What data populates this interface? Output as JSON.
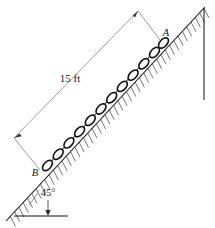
{
  "figure": {
    "type": "engineering-mechanics-free-body-diagram",
    "background_color": "#ffffff",
    "ink_color": "#111111",
    "dimension_color": "#8a8a8a",
    "labels": {
      "point_top": "A",
      "point_bottom": "B",
      "length": "15 ft",
      "angle": "45°"
    },
    "incline": {
      "angle_degrees": 45,
      "hatching_side": "below",
      "hatch_count": 46,
      "surface_start": {
        "x": 6,
        "y": 221
      },
      "surface_end": {
        "x": 205,
        "y": 7
      }
    },
    "chain": {
      "link_count": 12,
      "link_shape": "elongated-oval",
      "start": {
        "x": 45,
        "y": 168
      },
      "end": {
        "x": 163,
        "y": 42
      }
    },
    "dimension_line": {
      "label": "15 ft",
      "value": 15,
      "units": "ft",
      "arrow_ends": 2,
      "start": {
        "x": 13,
        "y": 139
      },
      "end": {
        "x": 139,
        "y": 10
      }
    },
    "angle_marker": {
      "label": "45°",
      "baseline_y": 216,
      "vertex": {
        "x": 6,
        "y": 221
      }
    },
    "wall": {
      "orientation": "vertical",
      "x": 204,
      "y_top": 8,
      "y_bottom": 100
    }
  }
}
